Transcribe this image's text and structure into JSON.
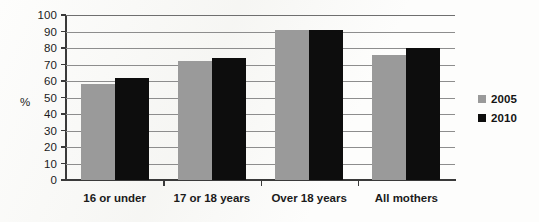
{
  "chart_data": {
    "type": "bar",
    "title": "",
    "xlabel": "",
    "ylabel": "%",
    "ylim": [
      0,
      100
    ],
    "ytick_step": 10,
    "yticks": [
      "100",
      "90",
      "80",
      "70",
      "60",
      "50",
      "40",
      "30",
      "20",
      "10",
      "0"
    ],
    "grid": true,
    "legend_position": "right",
    "categories": [
      "16 or under",
      "17 or 18 years",
      "Over 18 years",
      "All mothers"
    ],
    "series": [
      {
        "name": "2005",
        "color": "#9a9a9a",
        "values": [
          58,
          72,
          91,
          76
        ]
      },
      {
        "name": "2010",
        "color": "#0d0d0d",
        "values": [
          62,
          74,
          91,
          80
        ]
      }
    ]
  },
  "axis": {
    "y_unit_label": "%"
  },
  "legend": {
    "items": [
      {
        "label": "2005",
        "color": "#9a9a9a"
      },
      {
        "label": "2010",
        "color": "#0d0d0d"
      }
    ]
  }
}
